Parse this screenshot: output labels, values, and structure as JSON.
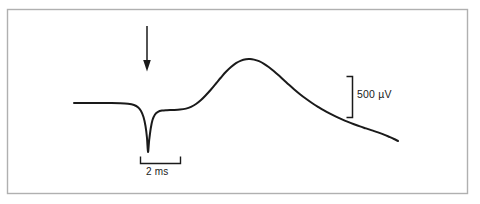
{
  "figure": {
    "type": "electrophysiology-trace",
    "background_color": "#ffffff",
    "frame_color": "#b0b0b0",
    "trace_color": "#1a1a1a",
    "annotation_color": "#1a1a1a"
  },
  "annotations": {
    "stimulus_arrow": {
      "name": "stimulus-marker-arrow",
      "direction": "down",
      "x": 147,
      "y_top": 26,
      "y_bottom": 70
    },
    "voltage_scale": {
      "label": "500 µV",
      "value": 500,
      "unit": "µV",
      "orientation": "vertical",
      "bar_x": 352,
      "bar_y_top": 76,
      "bar_y_bottom": 118
    },
    "time_scale": {
      "label": "2 ms",
      "value": 2,
      "unit": "ms",
      "orientation": "horizontal",
      "bar_y": 163,
      "bar_x_left": 140,
      "bar_x_right": 180
    }
  },
  "chart_data": {
    "type": "line",
    "title": "",
    "xlabel": "",
    "ylabel": "",
    "grid": false,
    "legend": "none",
    "axes_visible": false,
    "xlim": [
      74,
      400
    ],
    "ylim": [
      152,
      55
    ],
    "note": "Pixel-space coordinates; y increases downward. Baseline at y=103. Downward stimulus spike trough at (148,152). Broad positive field-potential peak apex at (248,59). Slow decay to (398,141).",
    "scale_reference": {
      "voltage_per_pixel_uV": 11.9,
      "voltage_bar_px": 42,
      "voltage_bar_uV": 500,
      "time_per_pixel_ms": 0.05,
      "time_bar_px": 40,
      "time_bar_ms": 2
    },
    "series": [
      {
        "name": "field-potential-trace",
        "color": "#1a1a1a",
        "points": [
          [
            74,
            103.0
          ],
          [
            86,
            103.0
          ],
          [
            98,
            103.0
          ],
          [
            110,
            103.1
          ],
          [
            120,
            103.3
          ],
          [
            128,
            103.8
          ],
          [
            134,
            105.0
          ],
          [
            138,
            107.2
          ],
          [
            141,
            111.0
          ],
          [
            143.5,
            117.0
          ],
          [
            145.5,
            126.0
          ],
          [
            147,
            138.0
          ],
          [
            148,
            152.0
          ],
          [
            149.2,
            140.0
          ],
          [
            150.8,
            128.0
          ],
          [
            152.5,
            120.0
          ],
          [
            155,
            114.5
          ],
          [
            158,
            111.8
          ],
          [
            162,
            110.6
          ],
          [
            167,
            110.2
          ],
          [
            173,
            110.0
          ],
          [
            180,
            109.6
          ],
          [
            186,
            108.6
          ],
          [
            191,
            106.8
          ],
          [
            196,
            104.0
          ],
          [
            201,
            100.0
          ],
          [
            206,
            95.0
          ],
          [
            211,
            89.5
          ],
          [
            216,
            83.5
          ],
          [
            221,
            77.5
          ],
          [
            226,
            71.8
          ],
          [
            231,
            67.0
          ],
          [
            236,
            63.2
          ],
          [
            241,
            60.6
          ],
          [
            246,
            59.2
          ],
          [
            250,
            59.0
          ],
          [
            254,
            59.6
          ],
          [
            259,
            61.2
          ],
          [
            264,
            63.8
          ],
          [
            269,
            67.2
          ],
          [
            274,
            71.2
          ],
          [
            279,
            75.6
          ],
          [
            284,
            80.2
          ],
          [
            289,
            84.8
          ],
          [
            294,
            89.2
          ],
          [
            300,
            94.2
          ],
          [
            306,
            98.8
          ],
          [
            312,
            103.0
          ],
          [
            318,
            106.8
          ],
          [
            324,
            110.4
          ],
          [
            330,
            113.6
          ],
          [
            336,
            116.6
          ],
          [
            342,
            119.4
          ],
          [
            348,
            121.9
          ],
          [
            354,
            124.2
          ],
          [
            360,
            126.4
          ],
          [
            366,
            128.4
          ],
          [
            372,
            130.4
          ],
          [
            378,
            132.4
          ],
          [
            384,
            134.6
          ],
          [
            390,
            137.2
          ],
          [
            394,
            139.0
          ],
          [
            398,
            141.0
          ]
        ]
      }
    ]
  }
}
